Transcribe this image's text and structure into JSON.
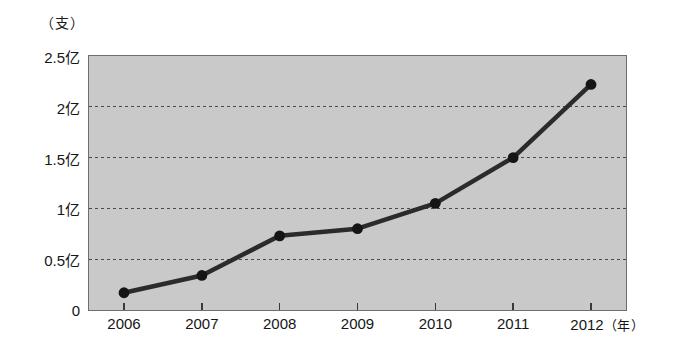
{
  "chart_data": {
    "type": "line",
    "title": "",
    "subtitle": "",
    "xlabel": "年",
    "ylabel": "支",
    "y_unit_label": "（支）",
    "x_unit_label": "（年）",
    "categories": [
      "2006",
      "2007",
      "2008",
      "2009",
      "2010",
      "2011",
      "2012"
    ],
    "x": [
      2006,
      2007,
      2008,
      2009,
      2010,
      2011,
      2012
    ],
    "values": [
      0.17,
      0.34,
      0.73,
      0.8,
      1.05,
      1.5,
      2.22
    ],
    "value_labels": [
      "0.17亿",
      "0.34亿",
      "0.73亿",
      "0.80亿",
      "1.05亿",
      "1.5亿",
      "2.22亿"
    ],
    "ylim": [
      0,
      2.5
    ],
    "yticks": [
      0,
      0.5,
      1,
      1.5,
      2,
      2.5
    ],
    "ytick_labels": [
      "0",
      "0.5亿",
      "1亿",
      "1.5亿",
      "2亿",
      "2.5亿"
    ],
    "xtick_labels": [
      "2006",
      "2007",
      "2008",
      "2009",
      "2010",
      "2011",
      "2012"
    ],
    "grid": true,
    "grid_style": "dotted-horizontal",
    "legend": null,
    "legend_position": "none",
    "series": [
      {
        "name": "",
        "values": [
          0.17,
          0.34,
          0.73,
          0.8,
          1.05,
          1.5,
          2.22
        ],
        "marker": "circle",
        "line_color": "#2b2b2b",
        "marker_color": "#151515"
      }
    ],
    "colors": {
      "plot_background": "#c9c9c9",
      "page_background": "#ffffff",
      "axis": "#6e6e6e",
      "gridline": "#4a4a4a",
      "line": "#2b2b2b",
      "marker": "#151515",
      "text": "#161616"
    }
  },
  "axes": {
    "y_unit": "（支）",
    "y_ticks": [
      {
        "label": "2.5亿",
        "value": 2.5
      },
      {
        "label": "2亿",
        "value": 2.0
      },
      {
        "label": "1.5亿",
        "value": 1.5
      },
      {
        "label": "1亿",
        "value": 1.0
      },
      {
        "label": "0.5亿",
        "value": 0.5
      },
      {
        "label": "0",
        "value": 0
      }
    ],
    "x_ticks": [
      {
        "label": "2006",
        "value": 2006
      },
      {
        "label": "2007",
        "value": 2007
      },
      {
        "label": "2008",
        "value": 2008
      },
      {
        "label": "2009",
        "value": 2009
      },
      {
        "label": "2010",
        "value": 2010
      },
      {
        "label": "2011",
        "value": 2011
      },
      {
        "label": "2012",
        "value": 2012
      }
    ],
    "x_unit": "（年）"
  }
}
